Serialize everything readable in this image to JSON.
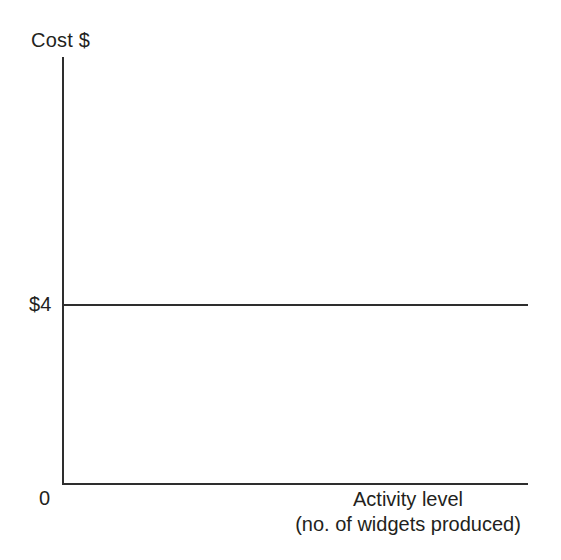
{
  "chart_data": {
    "type": "line",
    "title": "",
    "subtitle": "",
    "ylabel": "Cost $",
    "xlabel_lines": [
      "Activity level",
      "(no. of widgets produced)"
    ],
    "xlabel": "Activity level (no. of widgets produced)",
    "y_tick_labels": [
      "$4"
    ],
    "y_tick_values": [
      4
    ],
    "origin_label": "0",
    "x_tick_labels": [],
    "grid": false,
    "legend": null,
    "ylim": [
      0,
      10
    ],
    "xlim": [
      0,
      100
    ],
    "series": [
      {
        "name": "Variable cost per unit",
        "constant_value": 4,
        "x": [
          0,
          100
        ],
        "values": [
          4,
          4
        ]
      }
    ],
    "annotations": [],
    "line_color": "#2e2e2e",
    "axis_color": "#2e2e2e",
    "background_color": "#ffffff"
  }
}
